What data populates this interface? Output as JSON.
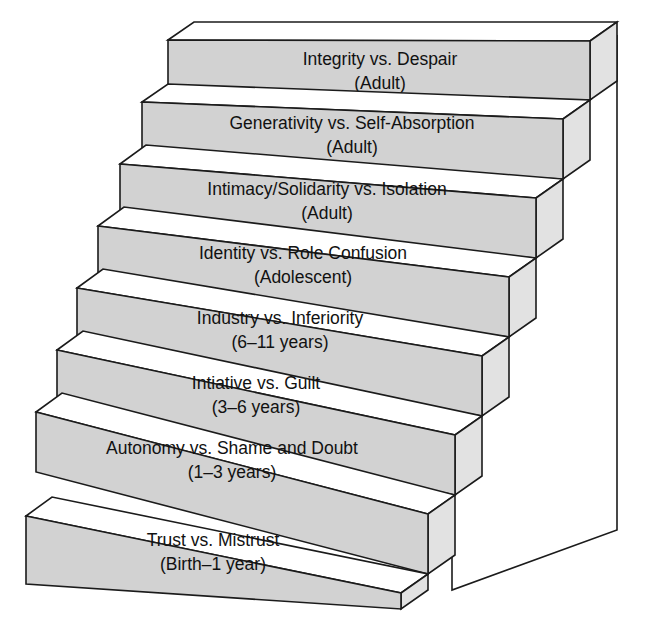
{
  "figure": {
    "kind": "staircase-diagram",
    "orientation": "ascending-left-to-right-upward",
    "colors": {
      "step_front": "#d2d2d2",
      "step_top": "#ffffff",
      "step_side": "#e2e2e2",
      "outline": "#1b1b1b",
      "background": "#ffffff",
      "text": "#111111"
    }
  },
  "steps": [
    {
      "index": 8,
      "position": "top",
      "stage": "Integrity vs. Despair",
      "age": "(Adult)"
    },
    {
      "index": 7,
      "position": "seventh",
      "stage": "Generativity vs. Self-Absorption",
      "age": "(Adult)"
    },
    {
      "index": 6,
      "position": "sixth",
      "stage": "Intimacy/Solidarity vs. Isolation",
      "age": "(Adult)"
    },
    {
      "index": 5,
      "position": "fifth",
      "stage": "Identity vs. Role Confusion",
      "age": "(Adolescent)"
    },
    {
      "index": 4,
      "position": "fourth",
      "stage": "Industry vs. Inferiority",
      "age": "(6–11 years)"
    },
    {
      "index": 3,
      "position": "third",
      "stage": "Intiative vs. Guilt",
      "age": "(3–6 years)"
    },
    {
      "index": 2,
      "position": "second",
      "stage": "Autonomy vs. Shame and Doubt",
      "age": "(1–3 years)"
    },
    {
      "index": 1,
      "position": "bottom",
      "stage": "Trust vs. Mistrust",
      "age": "(Birth–1 year)"
    }
  ]
}
